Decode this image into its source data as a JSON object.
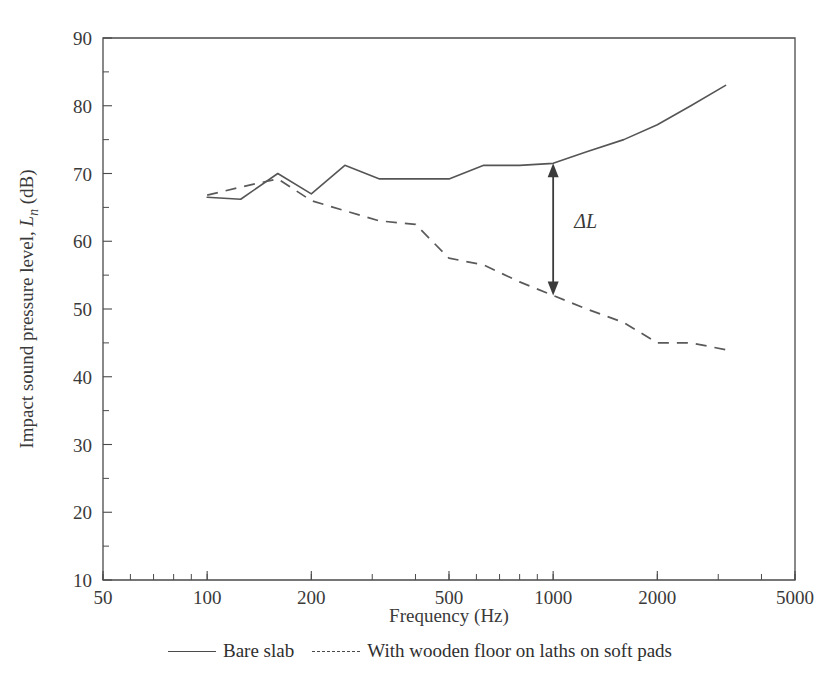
{
  "chart_data": {
    "type": "line",
    "title": "",
    "xlabel": "Frequency (Hz)",
    "ylabel_plain": "Impact sound pressure level, Ln (dB)",
    "ylabel_prefix": "Impact sound pressure level, ",
    "ylabel_symbol": "L",
    "ylabel_symbol_sub": "n",
    "ylabel_suffix": " (dB)",
    "xscale": "log",
    "yscale": "linear",
    "xlim": [
      50,
      5000
    ],
    "ylim": [
      10,
      90
    ],
    "grid": false,
    "xticks": [
      50,
      100,
      200,
      500,
      1000,
      2000,
      5000
    ],
    "xtick_labels": [
      "50",
      "100",
      "200",
      "500",
      "1000",
      "2000",
      "5000"
    ],
    "yticks": [
      10,
      20,
      30,
      40,
      50,
      60,
      70,
      80,
      90
    ],
    "ytick_labels": [
      "10",
      "20",
      "30",
      "40",
      "50",
      "60",
      "70",
      "80",
      "90"
    ],
    "yticks_minor": [
      15,
      25,
      35,
      45,
      55,
      65,
      75,
      85
    ],
    "legend_position": "below-axes",
    "series": [
      {
        "name": "Bare slab",
        "style": "solid",
        "color": "#555555",
        "x": [
          100,
          125,
          160,
          200,
          250,
          315,
          400,
          500,
          630,
          800,
          1000,
          1250,
          1600,
          2000,
          2500,
          3150
        ],
        "y": [
          66.5,
          66.2,
          70.0,
          67.0,
          71.2,
          69.2,
          69.2,
          69.2,
          71.2,
          71.2,
          71.5,
          73.2,
          75.0,
          77.2,
          80.0,
          83.0
        ]
      },
      {
        "name": "With wooden floor on laths on soft pads",
        "style": "dashed",
        "color": "#5a5a5a",
        "x": [
          100,
          125,
          160,
          200,
          250,
          315,
          400,
          500,
          630,
          800,
          1000,
          1250,
          1600,
          2000,
          2500,
          3150
        ],
        "y": [
          66.8,
          68.0,
          69.2,
          66.0,
          64.5,
          63.0,
          62.5,
          57.5,
          56.5,
          54.0,
          52.0,
          50.0,
          48.0,
          45.0,
          45.0,
          44.0
        ]
      }
    ],
    "annotations": [
      {
        "label": "ΔL",
        "type": "double-arrow-vertical",
        "x": 1000,
        "y_top": 71.5,
        "y_bottom": 52.0,
        "label_x": 1150,
        "label_y": 62.0
      }
    ]
  },
  "legend": {
    "items": [
      {
        "label": "Bare slab",
        "style": "solid"
      },
      {
        "label": "With wooden floor on laths on soft pads",
        "style": "dashed"
      }
    ]
  }
}
